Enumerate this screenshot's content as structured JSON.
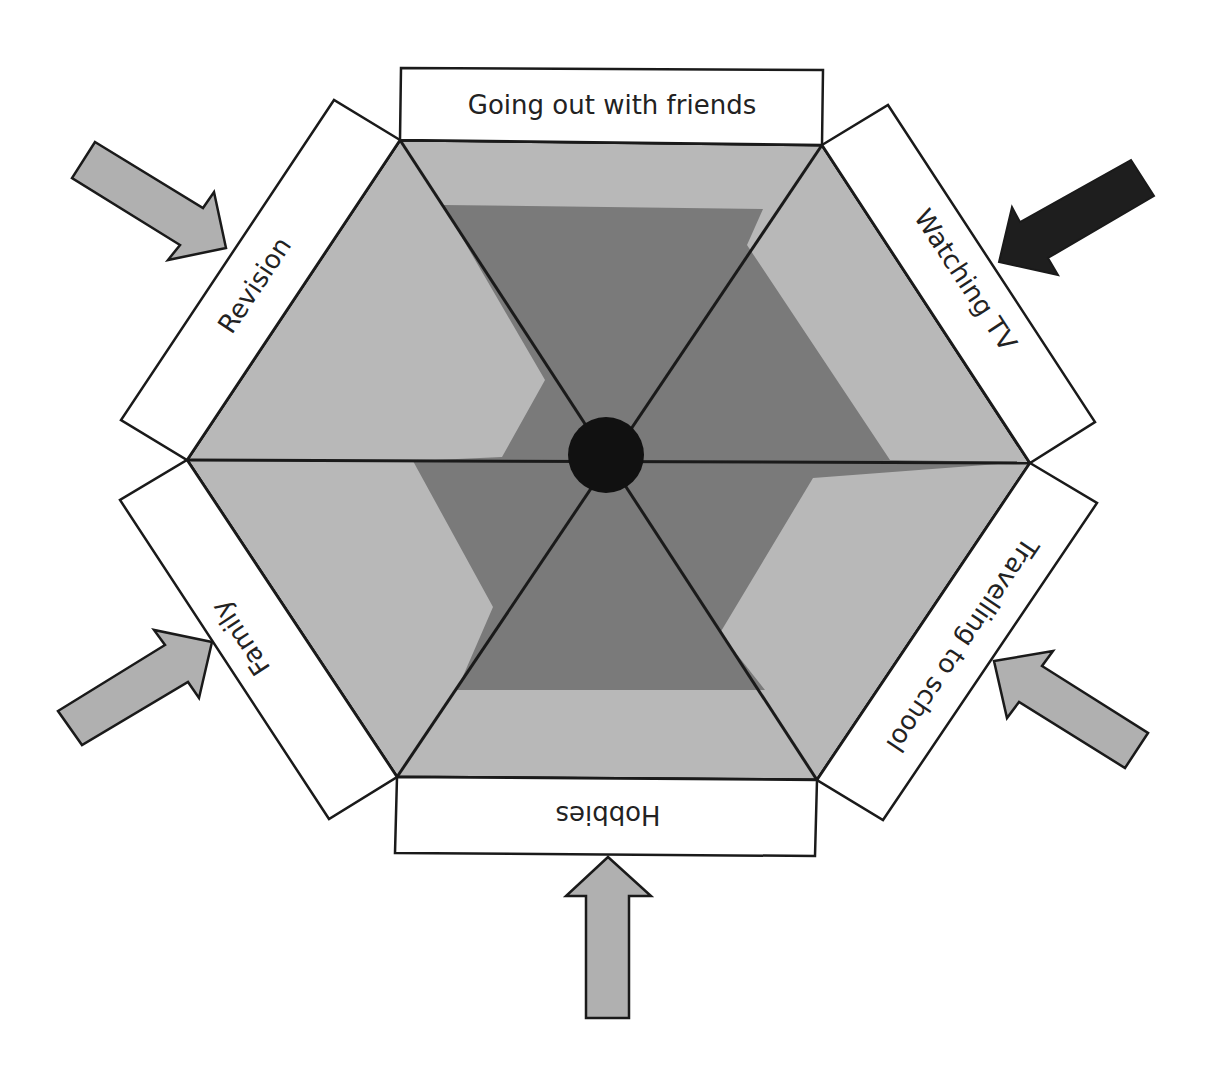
{
  "diagram": {
    "type": "hexagonal-balance-wheel",
    "colors": {
      "background": "#ffffff",
      "hexagon_fill": "#b8b8b8",
      "inner_shape_fill": "#7a7a7a",
      "hub_fill": "#111111",
      "outline": "#1a1a1a",
      "label_box_fill": "#ffffff",
      "arrow_light": "#b0b0b0",
      "arrow_dark": "#1e1e1e"
    },
    "segments": [
      {
        "id": "top",
        "label": "Going out with friends",
        "arrow": "none"
      },
      {
        "id": "upper-right",
        "label": "Watching TV",
        "arrow": "dark"
      },
      {
        "id": "lower-right",
        "label": "Travelling to school",
        "arrow": "light"
      },
      {
        "id": "bottom",
        "label": "Hobbies",
        "arrow": "light"
      },
      {
        "id": "lower-left",
        "label": "Family",
        "arrow": "light"
      },
      {
        "id": "upper-left",
        "label": "Revision",
        "arrow": "light"
      }
    ]
  }
}
